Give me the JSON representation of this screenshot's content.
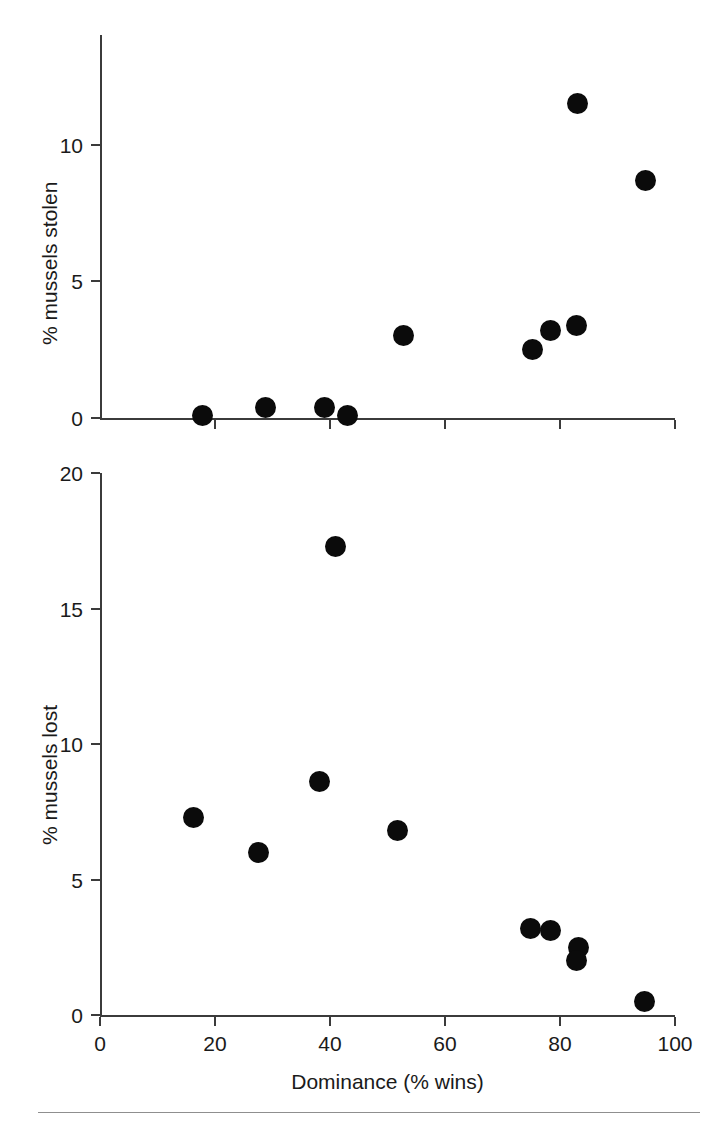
{
  "figure": {
    "background": "#ffffff",
    "marker_color": "#0b0b0b",
    "axis_color": "#3b3b3b",
    "footer_rule_color": "#8f8f8f"
  },
  "chart_data": [
    {
      "type": "scatter",
      "panel": "top",
      "title": "",
      "xlabel": "",
      "ylabel": "% mussels stolen",
      "xlim": [
        0,
        100
      ],
      "ylim": [
        0,
        12.5
      ],
      "grid": false,
      "legend": "none",
      "xticks": [
        0,
        20,
        40,
        60,
        80,
        100
      ],
      "xticklabels": [
        "",
        "",
        "",
        "",
        "",
        ""
      ],
      "yticks": [
        0,
        5,
        10
      ],
      "yticklabels": [
        "0",
        "5",
        "10"
      ],
      "points": [
        {
          "x": 17.9,
          "y": 0.1
        },
        {
          "x": 28.7,
          "y": 0.4
        },
        {
          "x": 39.0,
          "y": 0.4
        },
        {
          "x": 43.0,
          "y": 0.1
        },
        {
          "x": 52.7,
          "y": 3.0
        },
        {
          "x": 75.3,
          "y": 2.5
        },
        {
          "x": 78.4,
          "y": 3.2
        },
        {
          "x": 82.9,
          "y": 3.4
        },
        {
          "x": 83.1,
          "y": 11.5
        },
        {
          "x": 94.8,
          "y": 8.7
        }
      ]
    },
    {
      "type": "scatter",
      "panel": "bottom",
      "title": "",
      "xlabel": "Dominance (% wins)",
      "ylabel": "% mussels lost",
      "xlim": [
        0,
        100
      ],
      "ylim": [
        0,
        20
      ],
      "grid": false,
      "legend": "none",
      "xticks": [
        0,
        20,
        40,
        60,
        80,
        100
      ],
      "xticklabels": [
        "0",
        "20",
        "40",
        "60",
        "80",
        "100"
      ],
      "yticks": [
        0,
        5,
        10,
        15,
        20
      ],
      "yticklabels": [
        "0",
        "5",
        "10",
        "15",
        "20"
      ],
      "points": [
        {
          "x": 16.3,
          "y": 7.3
        },
        {
          "x": 27.5,
          "y": 6.0
        },
        {
          "x": 38.2,
          "y": 8.6
        },
        {
          "x": 40.9,
          "y": 17.3
        },
        {
          "x": 51.8,
          "y": 6.8
        },
        {
          "x": 74.9,
          "y": 3.2
        },
        {
          "x": 78.3,
          "y": 3.1
        },
        {
          "x": 83.2,
          "y": 2.5
        },
        {
          "x": 82.8,
          "y": 2.0
        },
        {
          "x": 94.7,
          "y": 0.5
        }
      ]
    }
  ]
}
